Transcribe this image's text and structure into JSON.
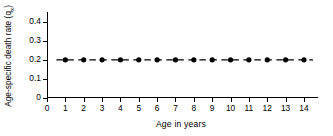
{
  "chart_data": {
    "type": "line",
    "title": "",
    "subtitle": "",
    "xlabel": "Age  in  years",
    "ylabel_full": "Age-specific death rate (qx)",
    "ylabel_main": "Age-specific death rate (q",
    "ylabel_sub": "x",
    "ylabel_close": ")",
    "x": [
      1,
      2,
      3,
      4,
      5,
      6,
      7,
      8,
      9,
      10,
      11,
      12,
      13,
      14
    ],
    "values": [
      0.2,
      0.2,
      0.2,
      0.2,
      0.2,
      0.2,
      0.2,
      0.2,
      0.2,
      0.2,
      0.2,
      0.2,
      0.2,
      0.2
    ],
    "series": [
      {
        "name": "Age-specific death rate",
        "values": [
          0.2,
          0.2,
          0.2,
          0.2,
          0.2,
          0.2,
          0.2,
          0.2,
          0.2,
          0.2,
          0.2,
          0.2,
          0.2,
          0.2
        ]
      }
    ],
    "xlim": [
      0,
      14.6
    ],
    "ylim": [
      0,
      0.45
    ],
    "xticks": [
      0,
      1,
      2,
      3,
      4,
      5,
      6,
      7,
      8,
      9,
      10,
      11,
      12,
      13,
      14
    ],
    "xtick_labels": [
      "0",
      "1",
      "2",
      "3",
      "4",
      "5",
      "6",
      "7",
      "8",
      "9",
      "10",
      "11",
      "12",
      "13",
      "14"
    ],
    "yticks": [
      0,
      0.1,
      0.2,
      0.3,
      0.4
    ],
    "ytick_labels": [
      "0",
      "0.1",
      "0.2",
      "0.3",
      "0.4"
    ],
    "grid": false,
    "legend": false,
    "legend_position": "none",
    "line_style": "dashed",
    "marker": "filled-circle",
    "line_color": "#000000",
    "marker_color": "#000000",
    "axis_color": "#000000",
    "background_color": "#ffffff",
    "annotations": []
  }
}
